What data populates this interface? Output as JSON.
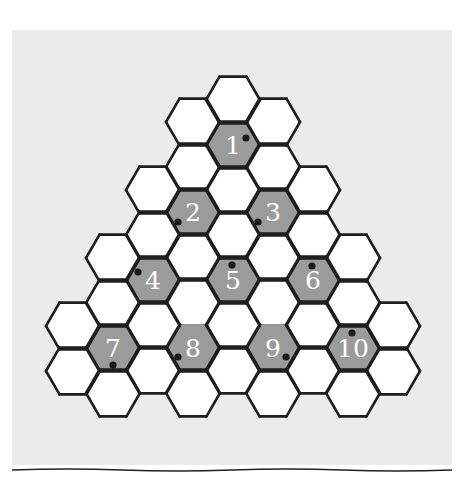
{
  "puzzle": {
    "type": "hexagonal-triangle-grid",
    "hex_side": 27,
    "columns": [
      {
        "x": 73,
        "y_centers": [
          326,
          371
        ]
      },
      {
        "x": 113,
        "y_centers": [
          258,
          303,
          348,
          393
        ]
      },
      {
        "x": 153,
        "y_centers": [
          190,
          235,
          280,
          325,
          370
        ]
      },
      {
        "x": 193,
        "y_centers": [
          122,
          167,
          212,
          257,
          302,
          348,
          393
        ]
      },
      {
        "x": 233,
        "y_centers": [
          100,
          145,
          190,
          235,
          280,
          325,
          370
        ]
      },
      {
        "x": 273,
        "y_centers": [
          122,
          167,
          212,
          257,
          302,
          348,
          393
        ]
      },
      {
        "x": 313,
        "y_centers": [
          190,
          235,
          280,
          325,
          370
        ]
      },
      {
        "x": 353,
        "y_centers": [
          258,
          303,
          348,
          393
        ]
      },
      {
        "x": 393,
        "y_centers": [
          326,
          371
        ]
      }
    ],
    "numbered_cells": [
      {
        "label": "1",
        "cx": 233,
        "cy": 145,
        "dot": [
          246,
          138
        ]
      },
      {
        "label": "2",
        "cx": 193,
        "cy": 212,
        "dot": [
          178,
          222
        ]
      },
      {
        "label": "3",
        "cx": 273,
        "cy": 212,
        "dot": [
          258,
          222
        ]
      },
      {
        "label": "4",
        "cx": 153,
        "cy": 280,
        "dot": [
          138,
          272
        ]
      },
      {
        "label": "5",
        "cx": 233,
        "cy": 280,
        "dot": [
          232,
          265
        ]
      },
      {
        "label": "6",
        "cx": 313,
        "cy": 280,
        "dot": [
          312,
          266
        ]
      },
      {
        "label": "7",
        "cx": 113,
        "cy": 348,
        "dot": [
          113,
          365
        ]
      },
      {
        "label": "8",
        "cx": 193,
        "cy": 348,
        "dot": [
          178,
          357
        ]
      },
      {
        "label": "9",
        "cx": 273,
        "cy": 348,
        "dot": [
          286,
          357
        ]
      },
      {
        "label": "10",
        "cx": 353,
        "cy": 348,
        "dot": [
          352,
          333
        ]
      }
    ]
  },
  "colors": {
    "panel_bg": "#ebebeb",
    "cell_fill": "#ffffff",
    "numbered_fill": "#9b9b9b",
    "inner_line": "#8a8a8a",
    "outline": "#1e1e1e",
    "number_text": "#ffffff",
    "dot": "#1a1a1a"
  }
}
